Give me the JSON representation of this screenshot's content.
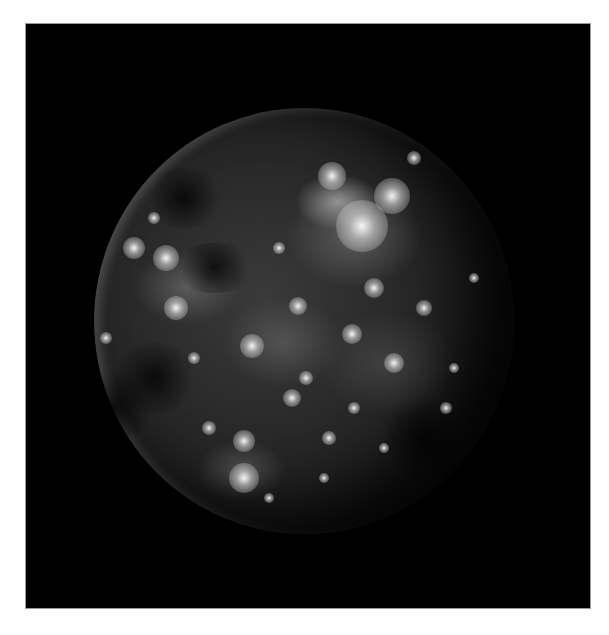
{
  "image": {
    "subject": "cratered moon",
    "background_color": "#000000",
    "page_color": "#ffffff",
    "moon_tone": "grayscale"
  },
  "bright_craters": [
    {
      "x": 238,
      "y": 68,
      "r": 14
    },
    {
      "x": 298,
      "y": 88,
      "r": 18
    },
    {
      "x": 268,
      "y": 118,
      "r": 26
    },
    {
      "x": 158,
      "y": 238,
      "r": 12
    },
    {
      "x": 204,
      "y": 198,
      "r": 9
    },
    {
      "x": 280,
      "y": 180,
      "r": 10
    },
    {
      "x": 258,
      "y": 226,
      "r": 10
    },
    {
      "x": 40,
      "y": 140,
      "r": 11
    },
    {
      "x": 72,
      "y": 150,
      "r": 13
    },
    {
      "x": 82,
      "y": 200,
      "r": 12
    },
    {
      "x": 198,
      "y": 290,
      "r": 9
    },
    {
      "x": 300,
      "y": 255,
      "r": 10
    },
    {
      "x": 150,
      "y": 333,
      "r": 11
    },
    {
      "x": 150,
      "y": 370,
      "r": 15
    },
    {
      "x": 212,
      "y": 270,
      "r": 7
    },
    {
      "x": 330,
      "y": 200,
      "r": 8
    },
    {
      "x": 352,
      "y": 300,
      "r": 6
    },
    {
      "x": 115,
      "y": 320,
      "r": 7
    },
    {
      "x": 235,
      "y": 330,
      "r": 7
    },
    {
      "x": 185,
      "y": 140,
      "r": 6
    },
    {
      "x": 12,
      "y": 230,
      "r": 6
    },
    {
      "x": 100,
      "y": 250,
      "r": 6
    },
    {
      "x": 60,
      "y": 110,
      "r": 6
    },
    {
      "x": 320,
      "y": 50,
      "r": 7
    },
    {
      "x": 380,
      "y": 170,
      "r": 5
    },
    {
      "x": 290,
      "y": 340,
      "r": 5
    },
    {
      "x": 260,
      "y": 300,
      "r": 6
    },
    {
      "x": 230,
      "y": 370,
      "r": 5
    },
    {
      "x": 175,
      "y": 390,
      "r": 5
    },
    {
      "x": 360,
      "y": 260,
      "r": 5
    }
  ],
  "dark_patches": [
    {
      "x": 90,
      "y": 90,
      "w": 80,
      "h": 60
    },
    {
      "x": 60,
      "y": 270,
      "w": 90,
      "h": 70
    },
    {
      "x": 20,
      "y": 300,
      "w": 70,
      "h": 80
    },
    {
      "x": 330,
      "y": 330,
      "w": 90,
      "h": 80
    },
    {
      "x": 120,
      "y": 160,
      "w": 80,
      "h": 50
    }
  ]
}
